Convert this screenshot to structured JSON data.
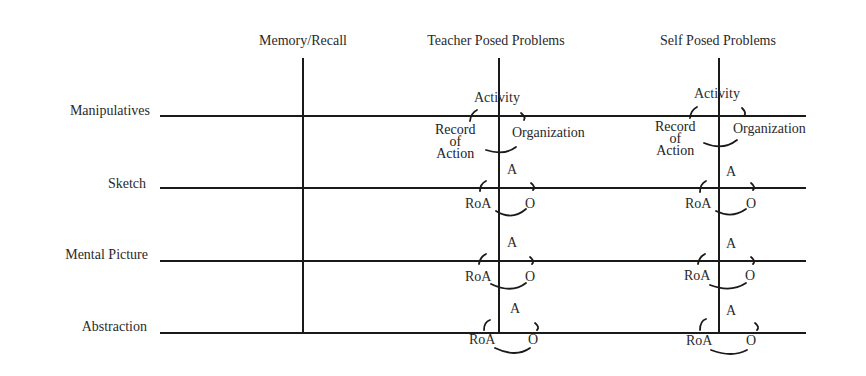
{
  "columns": [
    {
      "label": "Memory/Recall",
      "x": 303
    },
    {
      "label": "Teacher Posed Problems",
      "x": 499
    },
    {
      "label": "Self Posed Problems",
      "x": 719
    }
  ],
  "rows": [
    {
      "label": "Manipulatives",
      "y": 116
    },
    {
      "label": "Sketch",
      "y": 188
    },
    {
      "label": "Mental Picture",
      "y": 261
    },
    {
      "label": "Abstraction",
      "y": 333
    }
  ],
  "cycle_full": {
    "activity": "Activity",
    "record": "Record",
    "of": "of",
    "action": "Action",
    "organization": "Organization"
  },
  "cycle_abbrev": {
    "activity": "A",
    "record": "RoA",
    "organization": "O"
  },
  "colors": {
    "line": "#1a1a1a",
    "text": "#2a2a2a",
    "background": "#ffffff"
  }
}
